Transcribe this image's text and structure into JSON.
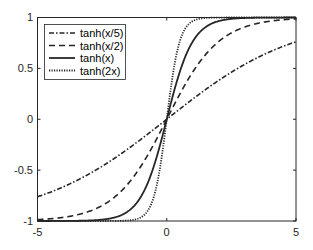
{
  "chart_data": {
    "type": "line",
    "title": "",
    "xlabel": "",
    "ylabel": "",
    "xlim": [
      -5,
      5
    ],
    "ylim": [
      -1,
      1
    ],
    "grid": false,
    "legend_position": "upper left",
    "x_ticks": [
      -5,
      0,
      5
    ],
    "x_tick_labels": [
      "-5",
      "0",
      "5"
    ],
    "y_ticks": [
      -1,
      -0.5,
      0,
      0.5,
      1
    ],
    "y_tick_labels": [
      "-1",
      "-0.5",
      "0",
      "0.5",
      "1"
    ],
    "x": [
      -5,
      -4,
      -3,
      -2,
      -1,
      -0.5,
      0,
      0.5,
      1,
      2,
      3,
      4,
      5
    ],
    "series": [
      {
        "name": "tanh(x/5)",
        "style": "dash-dot",
        "scale": 0.2,
        "values": [
          -0.762,
          -0.664,
          -0.537,
          -0.38,
          -0.197,
          -0.1,
          0,
          0.1,
          0.197,
          0.38,
          0.537,
          0.664,
          0.762
        ]
      },
      {
        "name": "tanh(x/2)",
        "style": "dashed",
        "scale": 0.5,
        "values": [
          -0.987,
          -0.964,
          -0.905,
          -0.762,
          -0.462,
          -0.245,
          0,
          0.245,
          0.462,
          0.762,
          0.905,
          0.964,
          0.987
        ]
      },
      {
        "name": "tanh(x)",
        "style": "solid",
        "scale": 1,
        "values": [
          -1.0,
          -0.999,
          -0.995,
          -0.964,
          -0.762,
          -0.462,
          0,
          0.462,
          0.762,
          0.964,
          0.995,
          0.999,
          1.0
        ]
      },
      {
        "name": "tanh(2x)",
        "style": "dotted",
        "scale": 2,
        "values": [
          -1.0,
          -1.0,
          -1.0,
          -0.999,
          -0.964,
          -0.762,
          0,
          0.762,
          0.964,
          0.999,
          1.0,
          1.0,
          1.0
        ]
      }
    ]
  },
  "legend": {
    "items": [
      "tanh(x/5)",
      "tanh(x/2)",
      "tanh(x)",
      "tanh(2x)"
    ]
  },
  "colors": {
    "line": "#262626",
    "axis": "#262626",
    "background": "#ffffff"
  }
}
